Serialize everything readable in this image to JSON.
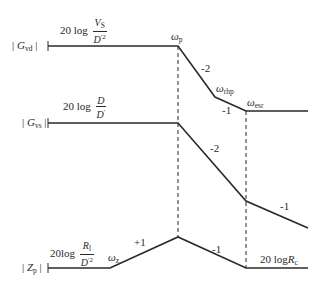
{
  "diagram": {
    "type": "bode-asymptote-plot",
    "traces": [
      {
        "name": "Gvd",
        "axis_label": {
          "prefix": "| ",
          "symbol": "G",
          "subscript": "vd",
          "suffix": " |"
        },
        "level_label": {
          "prefix": "20 log",
          "num_symbol": "V",
          "num_sub": "S",
          "den_symbol": "D",
          "den_sup": "′2"
        },
        "points": [
          [
            48,
            46
          ],
          [
            178,
            46
          ],
          [
            215,
            97
          ],
          [
            246,
            111
          ],
          [
            308,
            111
          ]
        ],
        "slopes": [
          "-2",
          "-1"
        ],
        "corner_labels": [
          {
            "symbol": "ω",
            "subscript": "p"
          },
          {
            "symbol": "ω",
            "subscript": "rhp"
          },
          {
            "symbol": "ω",
            "subscript": "esr"
          }
        ]
      },
      {
        "name": "Gvs",
        "axis_label": {
          "prefix": "| ",
          "symbol": "G",
          "subscript": "vs",
          "suffix": " |"
        },
        "level_label": {
          "prefix": "20 log",
          "num_symbol": "D",
          "den_symbol": "D",
          "den_sup": "′"
        },
        "points": [
          [
            48,
            123
          ],
          [
            178,
            123
          ],
          [
            246,
            201
          ],
          [
            308,
            228
          ]
        ],
        "slopes": [
          "-2",
          "-1"
        ]
      },
      {
        "name": "Zp",
        "axis_label": {
          "prefix": "| ",
          "symbol": "Z",
          "subscript": "p",
          "suffix": " |"
        },
        "level_label": {
          "prefix": "20log",
          "num_symbol": "R",
          "num_sub": "l",
          "den_symbol": "D",
          "den_sup": "′2"
        },
        "right_label": {
          "prefix": "20 log",
          "symbol": "R",
          "subscript": "c"
        },
        "points": [
          [
            48,
            268
          ],
          [
            110,
            268
          ],
          [
            178,
            237
          ],
          [
            246,
            268
          ],
          [
            308,
            268
          ]
        ],
        "slopes": [
          "+1",
          "-1"
        ],
        "corner_labels": [
          {
            "symbol": "ω",
            "subscript": "z"
          }
        ]
      }
    ],
    "dashed_verticals": [
      {
        "x": 178,
        "y1": 46,
        "y2": 237
      },
      {
        "x": 246,
        "y1": 111,
        "y2": 268
      }
    ],
    "colors": {
      "line": "#2a2a2a",
      "background": "#ffffff"
    }
  }
}
